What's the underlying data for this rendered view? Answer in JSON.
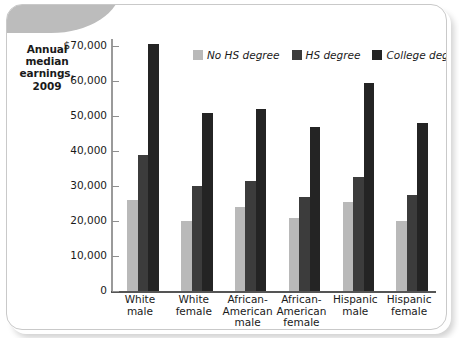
{
  "chart_data": {
    "type": "bar",
    "title": "Annual median earnings, 2009",
    "title_lines": [
      "Annual",
      "median",
      "earnings,",
      "2009"
    ],
    "xlabel": "",
    "ylabel": "Annual median earnings, 2009",
    "ylim": [
      0,
      72000
    ],
    "grid": false,
    "legend_position": "top-center",
    "categories": [
      "White male",
      "White female",
      "African-American male",
      "African-American female",
      "Hispanic male",
      "Hispanic female"
    ],
    "category_label_lines": [
      [
        "White",
        "male"
      ],
      [
        "White",
        "female"
      ],
      [
        "African-",
        "American",
        "male"
      ],
      [
        "African-",
        "American",
        "female"
      ],
      [
        "Hispanic",
        "male"
      ],
      [
        "Hispanic",
        "female"
      ]
    ],
    "ytick_labels": [
      "$70,000",
      "60,000",
      "50,000",
      "40,000",
      "30,000",
      "20,000",
      "10,000",
      "0"
    ],
    "ytick_values": [
      70000,
      60000,
      50000,
      40000,
      30000,
      20000,
      10000,
      0
    ],
    "series": [
      {
        "name": "No HS degree",
        "color": "#b9b9b9",
        "values": [
          26000,
          20000,
          24000,
          21000,
          25500,
          20000
        ]
      },
      {
        "name": "HS degree",
        "color": "#3c3c3c",
        "values": [
          39000,
          30000,
          31500,
          27000,
          32500,
          27500
        ]
      },
      {
        "name": "College degree",
        "color": "#242424",
        "values": [
          70500,
          51000,
          52000,
          47000,
          59500,
          48000
        ]
      }
    ]
  },
  "colors": {
    "no_hs_degree": "#b9b9b9",
    "hs_degree": "#3c3c3c",
    "college_degree": "#242424",
    "axis": "#8f8f8f",
    "baseline": "#555555",
    "card_border": "#c9c9c9",
    "decoration": "#bcbcbc",
    "text": "#1a1a1a"
  }
}
